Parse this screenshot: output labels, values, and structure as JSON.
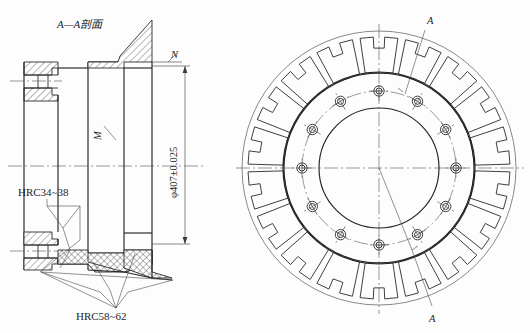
{
  "drawing": {
    "title": "A—A剖面",
    "background_color": "#fdfdfd",
    "line_color": "#2a2a2a",
    "section_view": {
      "label_N": "N",
      "label_M": "M",
      "dimension": "φ407±0.025",
      "note_soft": "HRC34~38",
      "note_hard": "HRC58~62"
    },
    "front_view": {
      "section_mark_top": "A",
      "section_mark_bottom": "A",
      "outer_segments": 18,
      "bolt_holes": 12,
      "outer_radius": 137,
      "segment_outer_radius": 131,
      "segment_inner_radius": 96,
      "flange_outer_radius": 95,
      "bore_radius": 60,
      "bolt_circle_radius": 77,
      "bolt_hole_radius": 5.2,
      "center_x": 379,
      "center_y": 168
    }
  }
}
